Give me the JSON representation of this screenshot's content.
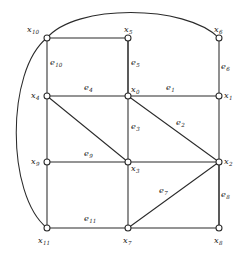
{
  "figure": {
    "type": "planar-graph-diagram",
    "background_color": "#ffffff",
    "line_color": "#2b2b2b",
    "width": 242,
    "height": 258
  },
  "vertices": [
    {
      "id": "x0",
      "base": "x",
      "sub": "0",
      "x": 128,
      "y": 96,
      "label_x": 131,
      "label_y": 85
    },
    {
      "id": "x1",
      "base": "x",
      "sub": "1",
      "x": 219,
      "y": 96,
      "label_x": 224,
      "label_y": 91
    },
    {
      "id": "x2",
      "base": "x",
      "sub": "2",
      "x": 219,
      "y": 162,
      "label_x": 224,
      "label_y": 157
    },
    {
      "id": "x3",
      "base": "x",
      "sub": "3",
      "x": 128,
      "y": 162,
      "label_x": 131,
      "label_y": 164
    },
    {
      "id": "x4",
      "base": "x",
      "sub": "4",
      "x": 47,
      "y": 96,
      "label_x": 31,
      "label_y": 91
    },
    {
      "id": "x5",
      "base": "x",
      "sub": "5",
      "x": 128,
      "y": 38,
      "label_x": 124,
      "label_y": 25
    },
    {
      "id": "x6",
      "base": "x",
      "sub": "6",
      "x": 219,
      "y": 38,
      "label_x": 214,
      "label_y": 25
    },
    {
      "id": "x7",
      "base": "x",
      "sub": "7",
      "x": 128,
      "y": 228,
      "label_x": 123,
      "label_y": 236
    },
    {
      "id": "x8",
      "base": "x",
      "sub": "8",
      "x": 219,
      "y": 228,
      "label_x": 214,
      "label_y": 236
    },
    {
      "id": "x9",
      "base": "x",
      "sub": "9",
      "x": 47,
      "y": 162,
      "label_x": 31,
      "label_y": 157
    },
    {
      "id": "x10",
      "base": "x",
      "sub": "10",
      "x": 47,
      "y": 38,
      "label_x": 27,
      "label_y": 25
    },
    {
      "id": "x11",
      "base": "x",
      "sub": "11",
      "x": 47,
      "y": 228,
      "label_x": 38,
      "label_y": 236
    }
  ],
  "edges": [
    {
      "id": "e1",
      "from": "x0",
      "to": "x1",
      "shape": "line",
      "label_x": 166,
      "label_y": 83
    },
    {
      "id": "e2",
      "from": "x0",
      "to": "x2",
      "shape": "line",
      "label_x": 176,
      "label_y": 118
    },
    {
      "id": "e3",
      "from": "x0",
      "to": "x3",
      "shape": "line",
      "label_x": 131,
      "label_y": 122
    },
    {
      "id": "e4",
      "from": "x0",
      "to": "x4",
      "shape": "line",
      "label_x": 84,
      "label_y": 83
    },
    {
      "id": "e5",
      "from": "x0",
      "to": "x5",
      "shape": "line",
      "label_x": 131,
      "label_y": 58
    },
    {
      "id": "e6",
      "from": "x6",
      "to": "x1",
      "shape": "line",
      "label_x": 221,
      "label_y": 62
    },
    {
      "id": "e7",
      "from": "x2",
      "to": "x7",
      "shape": "line",
      "label_x": 159,
      "label_y": 186
    },
    {
      "id": "e8",
      "from": "x2",
      "to": "x8",
      "shape": "line",
      "label_x": 221,
      "label_y": 190
    },
    {
      "id": "e9",
      "from": "x9",
      "to": "x3",
      "shape": "line",
      "label_x": 84,
      "label_y": 149
    },
    {
      "id": "e10",
      "from": "x10",
      "to": "x4",
      "shape": "line",
      "label_x": 50,
      "label_y": 58
    },
    {
      "id": "e11",
      "from": "x11",
      "to": "x7",
      "shape": "line",
      "label_x": 84,
      "label_y": 214
    }
  ],
  "unlabeled_edges": [
    {
      "from": "x10",
      "to": "x5",
      "shape": "line"
    },
    {
      "from": "x4",
      "to": "x3",
      "shape": "line"
    },
    {
      "from": "x4",
      "to": "x9",
      "shape": "line"
    },
    {
      "from": "x9",
      "to": "x11",
      "shape": "line"
    },
    {
      "from": "x3",
      "to": "x2",
      "shape": "line"
    },
    {
      "from": "x3",
      "to": "x7",
      "shape": "line"
    },
    {
      "from": "x7",
      "to": "x8",
      "shape": "line"
    },
    {
      "from": "x8",
      "to": "x2",
      "shape": "line"
    },
    {
      "from": "x5",
      "to": "x0",
      "shape": "line"
    },
    {
      "from": "x1",
      "to": "x2",
      "shape": "line"
    },
    {
      "from": "x10",
      "to": "x6",
      "shape": "arc-top"
    },
    {
      "from": "x10",
      "to": "x11",
      "shape": "arc-left"
    }
  ],
  "geometry": {
    "node_radius": 3.0,
    "arc_top_path": "M 47 38 C 75 4, 185 4, 219 38",
    "arc_left_path": "M 47 38 C 6 70, 6 195, 47 228"
  }
}
